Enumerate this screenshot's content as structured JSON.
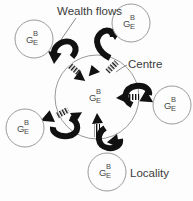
{
  "figure": {
    "background_color": "#fdfdfd",
    "line_color": "#8c8c8c",
    "arrow_color": "#111111",
    "text_color": "#3b3b3b"
  },
  "labels": {
    "wealth_flows": "Wealth flows",
    "centre": "Centre",
    "locality": "Locality"
  },
  "node": {
    "main": "G",
    "top": "B",
    "bottom": "E"
  },
  "nodes": [
    {
      "id": "centre",
      "role": "centre",
      "main": "G",
      "top": "B",
      "bottom": "E",
      "cx": 97,
      "cy": 97,
      "r": 42
    },
    {
      "id": "locality-ne",
      "role": "locality",
      "main": "G",
      "top": "B",
      "bottom": "E",
      "cx": 131,
      "cy": 23,
      "r": 19
    },
    {
      "id": "locality-nw",
      "role": "locality",
      "main": "G",
      "top": "B",
      "bottom": "E",
      "cx": 34,
      "cy": 39,
      "r": 19
    },
    {
      "id": "locality-e",
      "role": "locality",
      "main": "G",
      "top": "B",
      "bottom": "E",
      "cx": 172,
      "cy": 105,
      "r": 19
    },
    {
      "id": "locality-sw",
      "role": "locality",
      "main": "G",
      "top": "B",
      "bottom": "E",
      "cx": 25,
      "cy": 128,
      "r": 19
    },
    {
      "id": "locality-s",
      "role": "locality",
      "main": "G",
      "top": "B",
      "bottom": "E",
      "cx": 107,
      "cy": 172,
      "r": 19
    }
  ],
  "flows": {
    "inward_count": 5,
    "outward_count": 5,
    "inward_style": "striped-tail-arrow",
    "outward_style": "hooked-curl-arrow",
    "directions": [
      "ne",
      "nw",
      "e",
      "sw",
      "s"
    ]
  }
}
